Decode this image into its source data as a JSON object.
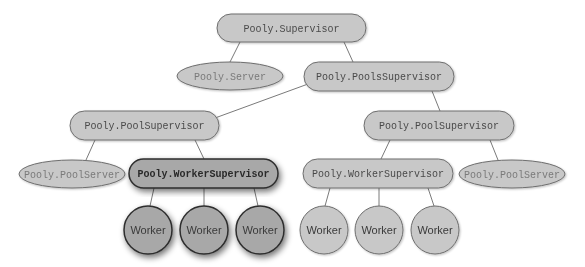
{
  "diagram": {
    "nodes": {
      "supervisor": {
        "label": "Pooly.Supervisor"
      },
      "server": {
        "label": "Pooly.Server"
      },
      "pools_supervisor": {
        "label": "Pooly.PoolsSupervisor"
      },
      "pool_supervisor_left": {
        "label": "Pooly.PoolSupervisor"
      },
      "pool_supervisor_right": {
        "label": "Pooly.PoolSupervisor"
      },
      "pool_server_left": {
        "label": "Pooly.PoolServer"
      },
      "pool_server_right": {
        "label": "Pooly.PoolServer"
      },
      "worker_supervisor_left": {
        "label": "Pooly.WorkerSupervisor"
      },
      "worker_supervisor_right": {
        "label": "Pooly.WorkerSupervisor"
      },
      "workers_left": [
        {
          "label": "Worker"
        },
        {
          "label": "Worker"
        },
        {
          "label": "Worker"
        }
      ],
      "workers_right": [
        {
          "label": "Worker"
        },
        {
          "label": "Worker"
        },
        {
          "label": "Worker"
        }
      ]
    },
    "colors": {
      "node_fill": "#c8c8c8",
      "node_stroke": "#6e6e6e",
      "highlight_fill": "#a8a8a8",
      "highlight_stroke": "#2e2e2e",
      "edge": "#7a7a7a"
    }
  }
}
